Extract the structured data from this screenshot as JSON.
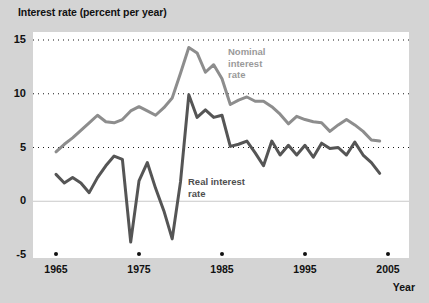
{
  "chart_data": {
    "type": "line",
    "title": "Interest rate (percent per year)",
    "xlabel": "Year",
    "ylabel": "Interest rate (percent per year)",
    "xlim": [
      1965,
      2005
    ],
    "ylim": [
      -5,
      15
    ],
    "ytick_labels": [
      "15",
      "10",
      "5",
      "0",
      "-5"
    ],
    "yticks": [
      15,
      10,
      5,
      0,
      -5
    ],
    "xtick_labels": [
      "1965",
      "1975",
      "1985",
      "1995",
      "2005"
    ],
    "xticks": [
      1965,
      1975,
      1985,
      1995,
      2005
    ],
    "grid": "horizontal dotted at 15, 10, 5; solid light line at 0",
    "legend_position": "inline annotations on curves",
    "x": [
      1965,
      1966,
      1967,
      1968,
      1969,
      1970,
      1971,
      1972,
      1973,
      1974,
      1975,
      1976,
      1977,
      1978,
      1979,
      1980,
      1981,
      1982,
      1983,
      1984,
      1985,
      1986,
      1987,
      1988,
      1989,
      1990,
      1991,
      1992,
      1993,
      1994,
      1995,
      1996,
      1997,
      1998,
      1999,
      2000,
      2001,
      2002,
      2003,
      2004
    ],
    "series": [
      {
        "name": "Nominal interest rate",
        "color": "#8d8d8d",
        "values": [
          4.6,
          5.3,
          5.9,
          6.6,
          7.3,
          8.0,
          7.4,
          7.3,
          7.6,
          8.4,
          8.8,
          8.4,
          8.0,
          8.7,
          9.6,
          11.9,
          14.3,
          13.8,
          12.0,
          12.7,
          11.4,
          9.0,
          9.4,
          9.7,
          9.3,
          9.3,
          8.8,
          8.1,
          7.2,
          7.9,
          7.6,
          7.4,
          7.3,
          6.5,
          7.1,
          7.6,
          7.1,
          6.5,
          5.7,
          5.6
        ],
        "annotation": "Nominal\ninterest\nrate"
      },
      {
        "name": "Real interest rate",
        "color": "#555555",
        "values": [
          2.5,
          1.7,
          2.2,
          1.7,
          0.8,
          2.2,
          3.3,
          4.2,
          3.9,
          -3.8,
          1.9,
          3.6,
          1.2,
          -0.9,
          -3.5,
          1.8,
          9.9,
          7.8,
          8.5,
          7.8,
          8.0,
          5.1,
          5.3,
          5.6,
          4.5,
          3.3,
          5.6,
          4.3,
          5.2,
          4.3,
          5.2,
          4.1,
          5.4,
          4.9,
          5.0,
          4.3,
          5.5,
          4.3,
          3.6,
          2.6
        ],
        "annotation": "Real interest\nrate"
      }
    ]
  },
  "annotations": {
    "nominal_line1": "Nominal",
    "nominal_line2": "interest",
    "nominal_line3": "rate",
    "real_line1": "Real interest",
    "real_line2": "rate"
  }
}
